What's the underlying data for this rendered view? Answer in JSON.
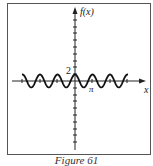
{
  "chart_data": {
    "type": "line",
    "title": "",
    "caption": "Figure 61",
    "xlabel": "x",
    "ylabel": "f(x)",
    "function": "f(x) = 2cos(2x)",
    "series": [
      {
        "name": "f(x)",
        "x": [
          -3.14,
          -2.36,
          -1.57,
          -0.79,
          0,
          0.79,
          1.57,
          2.36,
          3.14,
          3.93,
          4.71,
          5.5,
          6.28
        ],
        "values": [
          2,
          0,
          -2,
          0,
          2,
          0,
          -2,
          0,
          2,
          0,
          -2,
          0,
          2
        ]
      }
    ],
    "annotations": [
      {
        "text": "2",
        "x": 0,
        "y": 2
      },
      {
        "text": "π",
        "x": 3.14,
        "y": 0
      }
    ],
    "grid": false,
    "legend": "none"
  },
  "labels": {
    "y_axis": "f(x)",
    "x_axis": "x",
    "y_tick": "2",
    "x_tick": "π",
    "caption": "Figure 61"
  }
}
